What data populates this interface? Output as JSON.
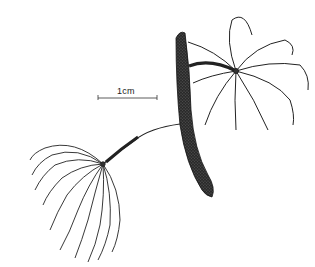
{
  "figure": {
    "scale_bar": {
      "label": "1cm"
    },
    "colors": {
      "ink": "#1a1a1a",
      "background": "#ffffff"
    }
  }
}
